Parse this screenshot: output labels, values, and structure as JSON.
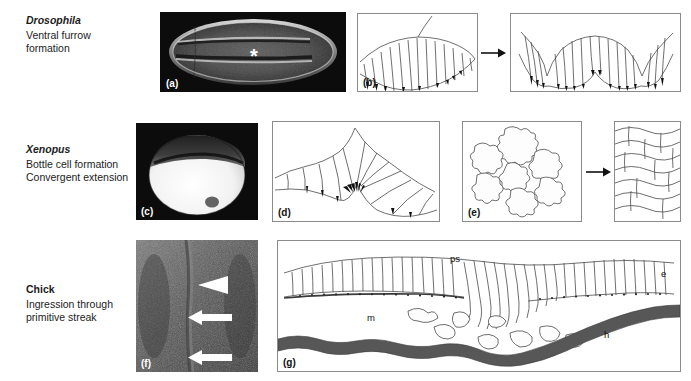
{
  "figure": {
    "kind": "developmental-biology-plate",
    "background": "#ffffff",
    "panel_border_color": "#8b8b8b",
    "micrograph_background": "#0c0c0c",
    "hypoblast_color": "#575757"
  },
  "rows": [
    {
      "id": "drosophila",
      "species": "Drosophila",
      "species_italic": true,
      "process_lines": [
        "Ventral furrow",
        "formation"
      ]
    },
    {
      "id": "xenopus",
      "species": "Xenopus",
      "species_italic": true,
      "process_lines": [
        "Bottle cell formation",
        "Convergent extension"
      ]
    },
    {
      "id": "chick",
      "species": "Chick",
      "species_italic": false,
      "process_lines": [
        "Ingression through",
        "primitive streak"
      ]
    }
  ],
  "panels": [
    {
      "id": "a",
      "label": "(a)",
      "type": "micrograph",
      "label_on_dark": true,
      "content": "drosophila-embryo-ventral-view",
      "marker": "*"
    },
    {
      "id": "b",
      "label": "(b)",
      "type": "diagram",
      "content": "ventral-furrow-cell-shape-change-sequence",
      "sub_panels": 2
    },
    {
      "id": "c",
      "label": "(c)",
      "type": "micrograph",
      "label_on_dark": true,
      "content": "xenopus-embryo-dorsal-lip"
    },
    {
      "id": "d",
      "label": "(d)",
      "type": "diagram",
      "content": "bottle-cells-apical-constriction"
    },
    {
      "id": "e",
      "label": "(e)",
      "type": "diagram",
      "content": "convergent-extension-cell-intercalation",
      "sub_panels": 2
    },
    {
      "id": "f",
      "label": "(f)",
      "type": "micrograph",
      "label_on_dark": true,
      "content": "chick-primitive-streak-surface-view"
    },
    {
      "id": "g",
      "label": "(g)",
      "type": "diagram",
      "content": "chick-primitive-streak-section"
    }
  ],
  "markers": {
    "asterisk": "*",
    "panel_f_pointers": [
      "arrowhead",
      "arrow",
      "arrow"
    ]
  },
  "annotations": {
    "panel_g": [
      {
        "key": "ps",
        "text": "ps"
      },
      {
        "key": "e",
        "text": "e"
      },
      {
        "key": "m",
        "text": "m"
      },
      {
        "key": "h",
        "text": "h"
      }
    ]
  }
}
